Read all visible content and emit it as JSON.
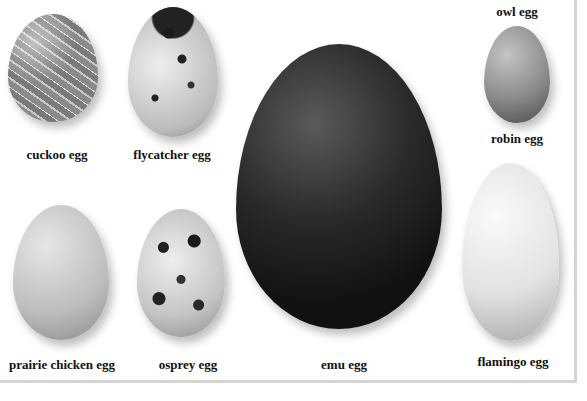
{
  "eggs": [
    {
      "id": "cuckoo",
      "label": "cuckoo egg"
    },
    {
      "id": "flycatcher",
      "label": "flycatcher egg"
    },
    {
      "id": "prairie-chicken",
      "label": "prairie chicken egg"
    },
    {
      "id": "osprey",
      "label": "osprey egg"
    },
    {
      "id": "emu",
      "label": "emu egg"
    },
    {
      "id": "owl",
      "label": "owl egg"
    },
    {
      "id": "robin",
      "label": "robin egg"
    },
    {
      "id": "flamingo",
      "label": "flamingo egg"
    }
  ]
}
